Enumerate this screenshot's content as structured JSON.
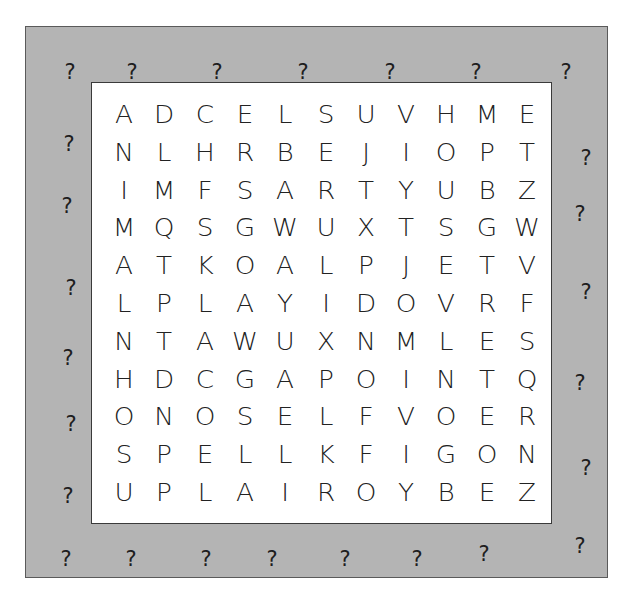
{
  "puzzle": {
    "type": "word-search",
    "rows": 11,
    "cols": 11,
    "colors": {
      "border_fill": "#b4b4b4",
      "board_fill": "#ffffff",
      "text": "#222222"
    },
    "grid": [
      [
        "A",
        "D",
        "C",
        "E",
        "L",
        "S",
        "U",
        "V",
        "H",
        "M",
        "E"
      ],
      [
        "N",
        "L",
        "H",
        "R",
        "B",
        "E",
        "J",
        "I",
        "O",
        "P",
        "T"
      ],
      [
        "I",
        "M",
        "F",
        "S",
        "A",
        "R",
        "T",
        "Y",
        "U",
        "B",
        "Z"
      ],
      [
        "M",
        "Q",
        "S",
        "G",
        "W",
        "U",
        "X",
        "T",
        "S",
        "G",
        "W"
      ],
      [
        "A",
        "T",
        "K",
        "O",
        "A",
        "L",
        "P",
        "J",
        "E",
        "T",
        "V"
      ],
      [
        "L",
        "P",
        "L",
        "A",
        "Y",
        "I",
        "D",
        "O",
        "V",
        "R",
        "F"
      ],
      [
        "N",
        "T",
        "A",
        "W",
        "U",
        "X",
        "N",
        "M",
        "L",
        "E",
        "S"
      ],
      [
        "H",
        "D",
        "C",
        "G",
        "A",
        "P",
        "O",
        "I",
        "N",
        "T",
        "Q"
      ],
      [
        "O",
        "N",
        "O",
        "S",
        "E",
        "L",
        "F",
        "V",
        "O",
        "E",
        "R"
      ],
      [
        "S",
        "P",
        "E",
        "L",
        "L",
        "K",
        "F",
        "I",
        "G",
        "O",
        "N"
      ],
      [
        "U",
        "P",
        "L",
        "A",
        "I",
        "R",
        "O",
        "Y",
        "B",
        "E",
        "Z"
      ]
    ]
  },
  "border": {
    "symbol": "?",
    "marks": [
      {
        "x": 60,
        "y": 62
      },
      {
        "x": 122,
        "y": 62
      },
      {
        "x": 207,
        "y": 62
      },
      {
        "x": 293,
        "y": 62
      },
      {
        "x": 380,
        "y": 62
      },
      {
        "x": 466,
        "y": 62
      },
      {
        "x": 556,
        "y": 62
      },
      {
        "x": 59,
        "y": 134
      },
      {
        "x": 57,
        "y": 196
      },
      {
        "x": 61,
        "y": 278
      },
      {
        "x": 58,
        "y": 348
      },
      {
        "x": 61,
        "y": 414
      },
      {
        "x": 58,
        "y": 486
      },
      {
        "x": 576,
        "y": 148
      },
      {
        "x": 570,
        "y": 204
      },
      {
        "x": 576,
        "y": 282
      },
      {
        "x": 570,
        "y": 373
      },
      {
        "x": 576,
        "y": 458
      },
      {
        "x": 570,
        "y": 536
      },
      {
        "x": 56,
        "y": 549
      },
      {
        "x": 121,
        "y": 549
      },
      {
        "x": 196,
        "y": 549
      },
      {
        "x": 262,
        "y": 549
      },
      {
        "x": 335,
        "y": 549
      },
      {
        "x": 407,
        "y": 549
      },
      {
        "x": 474,
        "y": 544
      }
    ]
  }
}
